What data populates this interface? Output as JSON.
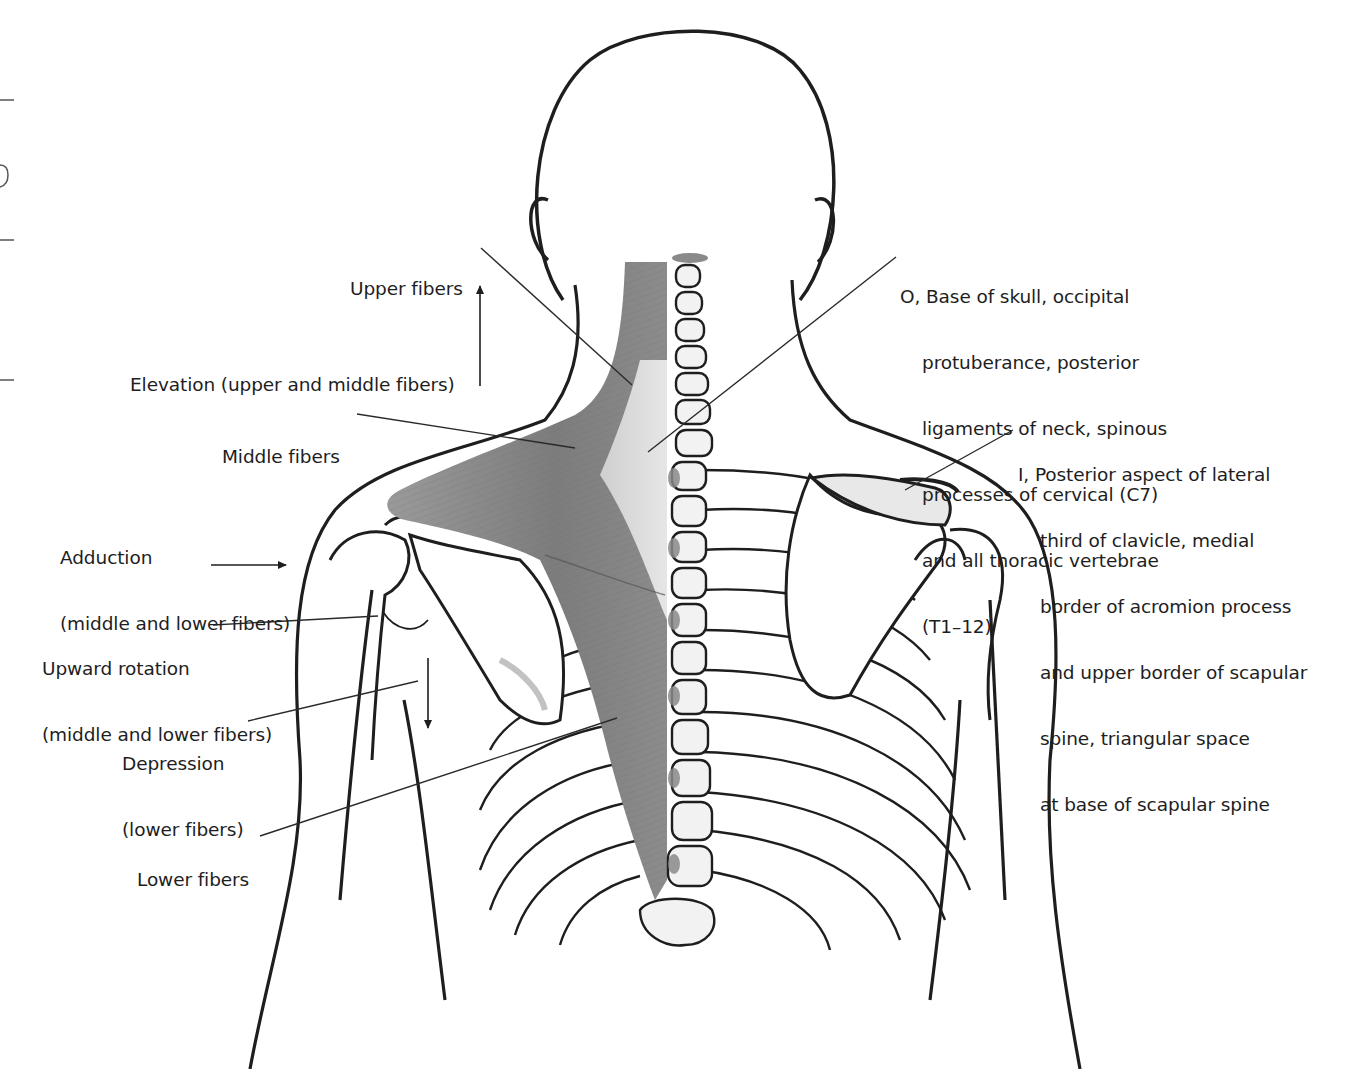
{
  "diagram": {
    "labels": [
      {
        "id": "upper-fibers",
        "lines": [
          "Upper fibers"
        ],
        "x": 350,
        "y": 234
      },
      {
        "id": "elevation",
        "lines": [
          "Elevation (upper and middle fibers)"
        ],
        "x": 130,
        "y": 330
      },
      {
        "id": "middle-fibers",
        "lines": [
          "Middle fibers"
        ],
        "x": 222,
        "y": 402
      },
      {
        "id": "adduction",
        "lines": [
          "Adduction",
          "(middle and lower fibers)"
        ],
        "x": 60,
        "y": 503
      },
      {
        "id": "upward-rotation",
        "lines": [
          "Upward rotation",
          "(middle and lower fibers)"
        ],
        "x": 42,
        "y": 614
      },
      {
        "id": "depression",
        "lines": [
          "Depression",
          "(lower fibers)"
        ],
        "x": 122,
        "y": 709
      },
      {
        "id": "lower-fibers",
        "lines": [
          "Lower fibers"
        ],
        "x": 137,
        "y": 825
      },
      {
        "id": "origin",
        "prefix": "O,",
        "lines": [
          "Base of skull, occipital",
          "protuberance, posterior",
          "ligaments of neck, spinous",
          "processes of cervical (C7)",
          "and all thoracic vertebrae",
          "(T1–12)"
        ],
        "x": 900,
        "y": 242
      },
      {
        "id": "insertion",
        "prefix": "I,",
        "lines": [
          "Posterior aspect of lateral",
          "third of clavicle, medial",
          "border of acromion process",
          "and upper border of scapular",
          "spine, triangular space",
          "at base of scapular spine"
        ],
        "x": 1018,
        "y": 420
      }
    ],
    "leader_lines": [
      {
        "for": "upper-fibers",
        "x1": 481,
        "y1": 248,
        "x2": 632,
        "y2": 385
      },
      {
        "for": "middle-fibers",
        "x1": 357,
        "y1": 414,
        "x2": 575,
        "y2": 448
      },
      {
        "for": "origin",
        "x1": 896,
        "y1": 257,
        "x2": 648,
        "y2": 452
      },
      {
        "for": "insertion",
        "x1": 1013,
        "y1": 430,
        "x2": 905,
        "y2": 490
      },
      {
        "for": "upward-rotation",
        "x1": 213,
        "y1": 625,
        "x2": 378,
        "y2": 616
      },
      {
        "for": "depression",
        "x1": 248,
        "y1": 721,
        "x2": 418,
        "y2": 681
      },
      {
        "for": "lower-fibers",
        "x1": 260,
        "y1": 836,
        "x2": 617,
        "y2": 718
      }
    ],
    "arrows": [
      {
        "for": "elevation",
        "direction": "up",
        "x": 480,
        "y1": 386,
        "y2": 286
      },
      {
        "for": "adduction",
        "direction": "right",
        "y": 565,
        "x1": 211,
        "x2": 286
      },
      {
        "for": "depression",
        "direction": "down",
        "x": 428,
        "y1": 658,
        "y2": 728
      }
    ],
    "colors": {
      "ink": "#1e1e1e",
      "muscle": "#8a8a8a",
      "muscle_dark": "#6e6e6e",
      "muscle_light": "#d8d8d8",
      "bone_shade": "#c8c8c8",
      "line": "#2a2a2a"
    }
  }
}
